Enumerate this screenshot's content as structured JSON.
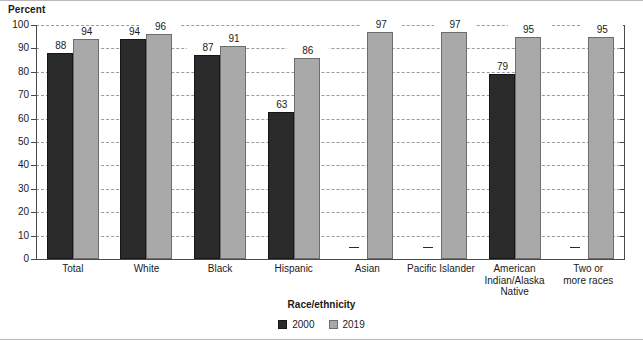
{
  "chart_data": {
    "type": "bar",
    "title": "",
    "xlabel": "Race/ethnicity",
    "ylabel": "Percent",
    "ylim": [
      0,
      100
    ],
    "ytick_labels": [
      "0",
      "10",
      "20",
      "30",
      "40",
      "50",
      "60",
      "70",
      "80",
      "90",
      "100"
    ],
    "ytick_values": [
      0,
      10,
      20,
      30,
      40,
      50,
      60,
      70,
      80,
      90,
      100
    ],
    "grid": true,
    "grid_style": "dashed-horizontal",
    "legend_position": "bottom-center",
    "legend_title": "Race/ethnicity",
    "missing_value_symbol": "—",
    "categories": [
      "Total",
      "White",
      "Black",
      "Hispanic",
      "Asian",
      "Pacific Islander",
      "American\nIndian/Alaska\nNative",
      "Two or\nmore races"
    ],
    "series": [
      {
        "name": "2000",
        "color": "#2b2b2b",
        "values": [
          88,
          94,
          87,
          63,
          null,
          null,
          79,
          null
        ],
        "labels": [
          "88",
          "94",
          "87",
          "63",
          "—",
          "—",
          "79",
          "—"
        ]
      },
      {
        "name": "2019",
        "color": "#a9a9a9",
        "values": [
          94,
          96,
          91,
          86,
          97,
          97,
          95,
          95
        ],
        "labels": [
          "94",
          "96",
          "91",
          "86",
          "97",
          "97",
          "95",
          "95"
        ]
      }
    ]
  }
}
